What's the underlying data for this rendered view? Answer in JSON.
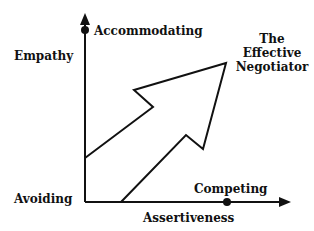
{
  "diagram": {
    "y_axis_label": "Empathy",
    "x_axis_label": "Assertiveness",
    "points": {
      "top": "Accommodating",
      "origin": "Avoiding",
      "right": "Competing"
    },
    "target": {
      "line1": "The",
      "line2": "Effective",
      "line3": "Negotiator"
    },
    "colors": {
      "ink": "#111111",
      "background": "#ffffff"
    }
  }
}
